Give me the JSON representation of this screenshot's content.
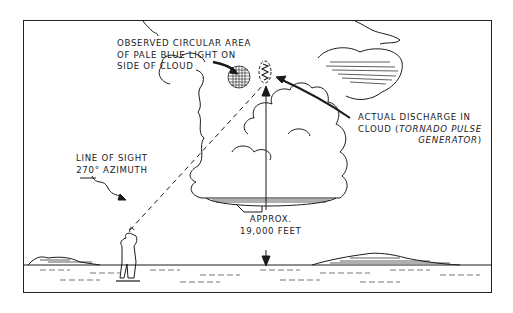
{
  "diagram": {
    "type": "illustration",
    "labels": {
      "observed_area": [
        "OBSERVED CIRCULAR AREA",
        "OF PALE BLUE LIGHT ON",
        "SIDE OF CLOUD"
      ],
      "discharge": {
        "line1": "ACTUAL DISCHARGE IN",
        "line2_prefix": "CLOUD (",
        "line2_italic": "TORNADO PULSE",
        "line3_italic": "GENERATOR",
        "line3_suffix": ")"
      },
      "line_of_sight": [
        "LINE OF SIGHT",
        "270° AZIMUTH"
      ],
      "altitude": [
        "APPROX.",
        "19,000 FEET"
      ]
    },
    "elements": [
      "observer-figure",
      "dashed-line-of-sight",
      "cumulonimbus-cloud",
      "circular-light-area",
      "discharge-oval",
      "altitude-arrow",
      "horizon-mountains"
    ],
    "colors": {
      "ink": "#1a1a1a",
      "background": "#ffffff"
    }
  }
}
